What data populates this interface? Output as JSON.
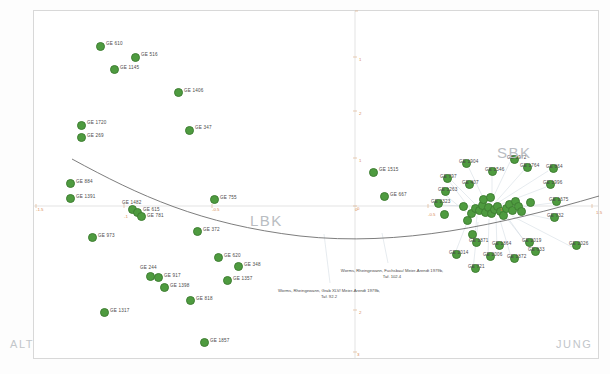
{
  "figure": {
    "background_color": "#ffffff",
    "point_color": "#4e9b3f",
    "axis_color": "#d9d9d9",
    "tick_color": "#d98a55",
    "curve_color": "#6b6b6b",
    "leader_color": "#c9d3dc"
  },
  "corner_labels": {
    "bottom_left": "ALT",
    "bottom_right": "JUNG"
  },
  "group_labels": [
    {
      "text": "LBK",
      "x": 250,
      "y": 212
    },
    {
      "text": "SBK",
      "x": 497,
      "y": 144
    }
  ],
  "axes": {
    "x_ticks": [
      {
        "label": "-1.5",
        "x": 36,
        "y": 207
      },
      {
        "label": "-1",
        "x": 124,
        "y": 214
      },
      {
        "label": "-0.5",
        "x": 212,
        "y": 207
      },
      {
        "label": "0",
        "x": 355,
        "y": 207
      },
      {
        "label": "-0.5",
        "x": 428,
        "y": 212
      },
      {
        "label": "1",
        "x": 500,
        "y": 207
      },
      {
        "label": "1.5",
        "x": 596,
        "y": 210
      }
    ],
    "y_ticks": [
      {
        "label": "1",
        "x": 359,
        "y": 57
      },
      {
        "label": "2",
        "x": 359,
        "y": 111
      },
      {
        "label": "1",
        "x": 359,
        "y": 158
      },
      {
        "label": "0",
        "x": 357,
        "y": 206
      },
      {
        "label": "2",
        "x": 359,
        "y": 310
      },
      {
        "label": "3",
        "x": 357,
        "y": 352
      }
    ],
    "x_axis_y": 206,
    "y_axis_x": 355
  },
  "annotations": [
    {
      "id": "note-left",
      "lines": [
        "Worms, Rheingewann, Grab XLV/ Meier-Arendt 1979b,",
        "Taf. 92.2"
      ],
      "x": 329,
      "y": 288,
      "leader_from_x": 324,
      "leader_from_y": 234
    },
    {
      "id": "note-right",
      "lines": [
        "Worms, Rheingewann, Fuchsbau/ Meier-Arendt 1979b,",
        "Taf. 102.4"
      ],
      "x": 392,
      "y": 268,
      "leader_from_x": 382,
      "leader_from_y": 233
    }
  ],
  "chart_data": {
    "type": "scatter",
    "title": "",
    "xlabel": "",
    "ylabel": "",
    "xlim": [
      -1.5,
      1.5
    ],
    "ylim": [
      -3,
      2
    ],
    "grid": false,
    "legend": "none",
    "series_name": "Gräber / Graves (GE)",
    "points": [
      {
        "label": "GE 610",
        "px": 99,
        "py": 45,
        "lx": 106,
        "ly": 44
      },
      {
        "label": "GE 516",
        "px": 134,
        "py": 56,
        "lx": 141,
        "ly": 55
      },
      {
        "label": "GE 1145",
        "px": 113,
        "py": 68,
        "lx": 120,
        "ly": 68
      },
      {
        "label": "GE 1406",
        "px": 177,
        "py": 91,
        "lx": 184,
        "ly": 91
      },
      {
        "label": "GE 1720",
        "px": 80,
        "py": 124,
        "lx": 87,
        "ly": 123
      },
      {
        "label": "GE 347",
        "px": 188,
        "py": 129,
        "lx": 195,
        "ly": 128
      },
      {
        "label": "GE 269",
        "px": 80,
        "py": 136,
        "lx": 87,
        "ly": 136
      },
      {
        "label": "GE 884",
        "px": 69,
        "py": 182,
        "lx": 76,
        "ly": 182
      },
      {
        "label": "GE 1391",
        "px": 69,
        "py": 197,
        "lx": 76,
        "ly": 197
      },
      {
        "label": "GE 755",
        "px": 213,
        "py": 198,
        "lx": 220,
        "ly": 198
      },
      {
        "label": "GE 1482",
        "px": 131,
        "py": 208,
        "lx": 122,
        "ly": 203
      },
      {
        "label": "GE 615",
        "px": 136,
        "py": 211,
        "lx": 143,
        "ly": 210
      },
      {
        "label": "GE 781",
        "px": 140,
        "py": 215,
        "lx": 147,
        "ly": 216
      },
      {
        "label": "GE 372",
        "px": 196,
        "py": 230,
        "lx": 203,
        "ly": 230
      },
      {
        "label": "GE 973",
        "px": 91,
        "py": 236,
        "lx": 98,
        "ly": 236
      },
      {
        "label": "GE 620",
        "px": 217,
        "py": 256,
        "lx": 224,
        "ly": 256
      },
      {
        "label": "GE 348",
        "px": 237,
        "py": 265,
        "lx": 244,
        "ly": 265
      },
      {
        "label": "GE 244",
        "px": 149,
        "py": 275,
        "lx": 140,
        "ly": 268
      },
      {
        "label": "GE 917",
        "px": 157,
        "py": 276,
        "lx": 164,
        "ly": 276
      },
      {
        "label": "GE 1357",
        "px": 226,
        "py": 279,
        "lx": 233,
        "ly": 279
      },
      {
        "label": "GE 1398",
        "px": 163,
        "py": 286,
        "lx": 170,
        "ly": 286
      },
      {
        "label": "GE 818",
        "px": 189,
        "py": 299,
        "lx": 196,
        "ly": 299
      },
      {
        "label": "GE 1317",
        "px": 103,
        "py": 311,
        "lx": 110,
        "ly": 311
      },
      {
        "label": "GE 1857",
        "px": 203,
        "py": 341,
        "lx": 210,
        "ly": 341
      },
      {
        "label": "GE 1515",
        "px": 372,
        "py": 171,
        "lx": 379,
        "ly": 170
      },
      {
        "label": "GE 667",
        "px": 383,
        "py": 195,
        "lx": 390,
        "ly": 195
      },
      {
        "label": "GE 1904",
        "px": 465,
        "py": 162,
        "lx": 459,
        "ly": 162
      },
      {
        "label": "GE 1972",
        "px": 513,
        "py": 158,
        "lx": 507,
        "ly": 158
      },
      {
        "label": "GE 1764",
        "px": 526,
        "py": 166,
        "lx": 520,
        "ly": 166
      },
      {
        "label": "GE 864",
        "px": 552,
        "py": 167,
        "lx": 546,
        "ly": 167
      },
      {
        "label": "GE 1996",
        "px": 549,
        "py": 183,
        "lx": 543,
        "ly": 183
      },
      {
        "label": "GE 1546",
        "px": 491,
        "py": 170,
        "lx": 485,
        "ly": 170
      },
      {
        "label": "GE 797",
        "px": 446,
        "py": 177,
        "lx": 440,
        "ly": 177
      },
      {
        "label": "GE 407",
        "px": 468,
        "py": 183,
        "lx": 462,
        "ly": 183
      },
      {
        "label": "GE 1263",
        "px": 444,
        "py": 190,
        "lx": 438,
        "ly": 190
      },
      {
        "label": "GE 2323",
        "px": 437,
        "py": 202,
        "lx": 431,
        "ly": 202
      },
      {
        "label": "GE 1675",
        "px": 555,
        "py": 200,
        "lx": 549,
        "ly": 200
      },
      {
        "label": "GE 732",
        "px": 553,
        "py": 216,
        "lx": 547,
        "ly": 216
      },
      {
        "label": "GE 2019",
        "px": 528,
        "py": 241,
        "lx": 522,
        "ly": 241
      },
      {
        "label": "GE 2026",
        "px": 575,
        "py": 244,
        "lx": 569,
        "ly": 244
      },
      {
        "label": "GE 633",
        "px": 534,
        "py": 250,
        "lx": 528,
        "ly": 250
      },
      {
        "label": "GE 1864",
        "px": 498,
        "py": 244,
        "lx": 492,
        "ly": 244
      },
      {
        "label": "GE 1872",
        "px": 513,
        "py": 257,
        "lx": 507,
        "ly": 257
      },
      {
        "label": "GE 2006",
        "px": 489,
        "py": 255,
        "lx": 483,
        "ly": 255
      },
      {
        "label": "GE 1871",
        "px": 475,
        "py": 241,
        "lx": 469,
        "ly": 241
      },
      {
        "label": "GE 2014",
        "px": 455,
        "py": 253,
        "lx": 449,
        "ly": 253
      },
      {
        "label": "GE 721",
        "px": 474,
        "py": 267,
        "lx": 468,
        "ly": 267
      }
    ],
    "cluster_points": [
      {
        "px": 462,
        "py": 205
      },
      {
        "px": 470,
        "py": 212
      },
      {
        "px": 474,
        "py": 207
      },
      {
        "px": 478,
        "py": 209
      },
      {
        "px": 481,
        "py": 204
      },
      {
        "px": 484,
        "py": 211
      },
      {
        "px": 487,
        "py": 206
      },
      {
        "px": 490,
        "py": 212
      },
      {
        "px": 493,
        "py": 208
      },
      {
        "px": 496,
        "py": 205
      },
      {
        "px": 499,
        "py": 210
      },
      {
        "px": 502,
        "py": 214
      },
      {
        "px": 505,
        "py": 207
      },
      {
        "px": 508,
        "py": 203
      },
      {
        "px": 511,
        "py": 209
      },
      {
        "px": 514,
        "py": 200
      },
      {
        "px": 517,
        "py": 205
      },
      {
        "px": 520,
        "py": 210
      },
      {
        "px": 482,
        "py": 198
      },
      {
        "px": 489,
        "py": 196
      },
      {
        "px": 466,
        "py": 219
      },
      {
        "px": 471,
        "py": 233
      },
      {
        "px": 443,
        "py": 213
      },
      {
        "px": 529,
        "py": 201
      }
    ],
    "trend_curve": {
      "description": "fitted parabola (seriation arch)",
      "path": "M 72,159 C 140,196 200,224 300,236 C 400,247 500,225 599,196"
    }
  }
}
